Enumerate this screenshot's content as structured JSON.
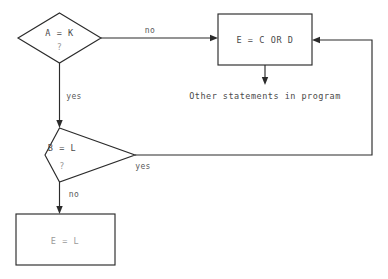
{
  "diagram": {
    "type": "flowchart",
    "background_color": "#ffffff",
    "line_color": "#2b2b2b",
    "text_color": "#4a4a4a",
    "nodes": [
      {
        "id": "decision-a-k",
        "shape": "diamond",
        "line1": "A = K",
        "line2": "?"
      },
      {
        "id": "process-e-c-or-d",
        "shape": "rectangle",
        "text": "E = C OR D"
      },
      {
        "id": "decision-b-l",
        "shape": "diamond",
        "line1": "B = L",
        "line2": "?"
      },
      {
        "id": "process-e-l",
        "shape": "rectangle",
        "text": "E = L"
      }
    ],
    "annotations": [
      {
        "id": "other-statements",
        "text": "Other statements in program"
      }
    ],
    "edge_labels": {
      "a_k_no": "no",
      "a_k_yes": "yes",
      "b_l_yes": "yes",
      "b_l_no": "no"
    }
  }
}
